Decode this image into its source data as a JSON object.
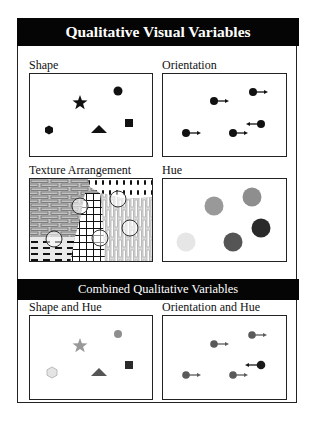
{
  "title": "Qualitative Visual Variables",
  "combined_title": "Combined Qualitative Variables",
  "panels": {
    "shape": {
      "label": "Shape",
      "symbols": [
        "star",
        "circle",
        "hexagon",
        "triangle",
        "square"
      ],
      "color": "#111111"
    },
    "orientation": {
      "label": "Orientation",
      "symbols": [
        "arrow-right",
        "arrow-right",
        "arrow-left",
        "arrow-right",
        "arrow-right"
      ],
      "color": "#111111"
    },
    "texture": {
      "label": "Texture Arrangement",
      "textures": [
        "brick-horizontal",
        "dashes-vertical",
        "grid",
        "brick-vertical",
        "dashes-horizontal"
      ]
    },
    "hue": {
      "label": "Hue",
      "colors": [
        "#999999",
        "#8e8e8e",
        "#e6e6e6",
        "#555555",
        "#2a2a2a"
      ]
    },
    "shape_hue": {
      "label": "Shape and Hue",
      "colors": {
        "star": "#999999",
        "circle": "#8e8e8e",
        "hexagon": "#e4e4e4",
        "triangle": "#555555",
        "square": "#2a2a2a"
      }
    },
    "orientation_hue": {
      "label": "Orientation and Hue",
      "colors": [
        "#5a5a5a",
        "#5a5a5a",
        "#1a1a1a",
        "#5a5a5a",
        "#5a5a5a"
      ]
    }
  }
}
